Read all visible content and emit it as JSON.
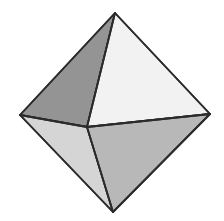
{
  "figure": {
    "name": "octahedron",
    "canvas": {
      "width": 224,
      "height": 221,
      "background": "#ffffff"
    },
    "edge_color": "#2b2b2b",
    "edge_width": 1.8,
    "vertices": {
      "top": {
        "label": "top-vertex",
        "x": 115,
        "y": 13
      },
      "left": {
        "label": "left-vertex",
        "x": 20,
        "y": 115
      },
      "right": {
        "label": "right-vertex",
        "x": 210,
        "y": 114
      },
      "bottom": {
        "label": "bottom-vertex",
        "x": 113,
        "y": 212
      },
      "center": {
        "label": "front-vertex",
        "x": 87,
        "y": 127
      }
    },
    "faces": [
      {
        "id": "upper-left-face",
        "label": "Upper left face",
        "fill": "#949494",
        "points": "115,13 20,115 87,127"
      },
      {
        "id": "upper-right-face",
        "label": "Upper right face",
        "fill": "#f2f2f2",
        "points": "115,13 210,114 87,127"
      },
      {
        "id": "lower-left-face",
        "label": "Lower left face",
        "fill": "#d5d5d5",
        "points": "20,115 113,212 87,127"
      },
      {
        "id": "lower-right-face",
        "label": "Lower right face",
        "fill": "#b8b8b8",
        "points": "210,114 113,212 87,127"
      }
    ],
    "edges": [
      {
        "id": "edge-top-left",
        "label": "top to left",
        "x1": 115,
        "y1": 13,
        "x2": 20,
        "y2": 115
      },
      {
        "id": "edge-top-right",
        "label": "top to right",
        "x1": 115,
        "y1": 13,
        "x2": 210,
        "y2": 114
      },
      {
        "id": "edge-left-bottom",
        "label": "left to bottom",
        "x1": 20,
        "y1": 115,
        "x2": 113,
        "y2": 212
      },
      {
        "id": "edge-right-bottom",
        "label": "right to bottom",
        "x1": 210,
        "y1": 114,
        "x2": 113,
        "y2": 212
      },
      {
        "id": "edge-top-center",
        "label": "top to center",
        "x1": 115,
        "y1": 13,
        "x2": 87,
        "y2": 127
      },
      {
        "id": "edge-left-center",
        "label": "left to center",
        "x1": 20,
        "y1": 115,
        "x2": 87,
        "y2": 127
      },
      {
        "id": "edge-right-center",
        "label": "right to center",
        "x1": 210,
        "y1": 114,
        "x2": 87,
        "y2": 127
      },
      {
        "id": "edge-bottom-center",
        "label": "bottom to center",
        "x1": 113,
        "y1": 212,
        "x2": 87,
        "y2": 127
      }
    ]
  }
}
